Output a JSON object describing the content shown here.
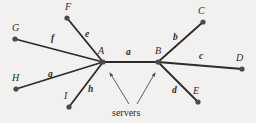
{
  "figure": {
    "background_color": "#f2f1ef",
    "stroke_color": "#2b2b2b",
    "node_color": "#4a4a4a",
    "annotation": {
      "label": "servers",
      "x": 112,
      "y": 108,
      "arrows": [
        {
          "name": "arrow-to-a",
          "from_x": 129,
          "from_y": 104,
          "to_x": 110,
          "to_y": 73
        },
        {
          "name": "arrow-to-b",
          "from_x": 137,
          "from_y": 104,
          "to_x": 155,
          "to_y": 73
        }
      ]
    },
    "nodes": [
      {
        "id": "A",
        "label": "A",
        "x": 103,
        "y": 62,
        "label_x": 98,
        "label_y": 46
      },
      {
        "id": "B",
        "label": "B",
        "x": 158,
        "y": 62,
        "label_x": 155,
        "label_y": 46
      },
      {
        "id": "C",
        "label": "C",
        "x": 203,
        "y": 22,
        "label_x": 198,
        "label_y": 6
      },
      {
        "id": "D",
        "label": "D",
        "x": 242,
        "y": 69,
        "label_x": 236,
        "label_y": 53
      },
      {
        "id": "E",
        "label": "E",
        "x": 198,
        "y": 102,
        "label_x": 193,
        "label_y": 86
      },
      {
        "id": "F",
        "label": "F",
        "x": 67,
        "y": 18,
        "label_x": 65,
        "label_y": 2
      },
      {
        "id": "G",
        "label": "G",
        "x": 15,
        "y": 39,
        "label_x": 12,
        "label_y": 23
      },
      {
        "id": "H",
        "label": "H",
        "x": 16,
        "y": 89,
        "label_x": 12,
        "label_y": 73
      },
      {
        "id": "I",
        "label": "I",
        "x": 69,
        "y": 107,
        "label_x": 64,
        "label_y": 91
      }
    ],
    "edges": [
      {
        "id": "a",
        "label": "a",
        "from": "A",
        "to": "B",
        "label_x": 126,
        "label_y": 48
      },
      {
        "id": "b",
        "label": "b",
        "from": "B",
        "to": "C",
        "label_x": 173,
        "label_y": 33
      },
      {
        "id": "c",
        "label": "c",
        "from": "B",
        "to": "D",
        "label_x": 199,
        "label_y": 52
      },
      {
        "id": "d",
        "label": "d",
        "from": "B",
        "to": "E",
        "label_x": 172,
        "label_y": 86
      },
      {
        "id": "e",
        "label": "e",
        "from": "A",
        "to": "F",
        "label_x": 85,
        "label_y": 30
      },
      {
        "id": "f",
        "label": "f",
        "from": "A",
        "to": "G",
        "label_x": 51,
        "label_y": 34
      },
      {
        "id": "g",
        "label": "g",
        "from": "A",
        "to": "H",
        "label_x": 48,
        "label_y": 70
      },
      {
        "id": "h",
        "label": "h",
        "from": "A",
        "to": "I",
        "label_x": 88,
        "label_y": 85
      }
    ]
  },
  "chart_data": {
    "type": "diagram",
    "title": "",
    "node_ids": [
      "A",
      "B",
      "C",
      "D",
      "E",
      "F",
      "G",
      "H",
      "I"
    ],
    "edge_ids": [
      "a",
      "b",
      "c",
      "d",
      "e",
      "f",
      "g",
      "h"
    ],
    "edge_list": [
      [
        "A",
        "B",
        "a"
      ],
      [
        "B",
        "C",
        "b"
      ],
      [
        "B",
        "D",
        "c"
      ],
      [
        "B",
        "E",
        "d"
      ],
      [
        "A",
        "F",
        "e"
      ],
      [
        "A",
        "G",
        "f"
      ],
      [
        "A",
        "H",
        "g"
      ],
      [
        "A",
        "I",
        "h"
      ]
    ],
    "annotations": [
      {
        "text": "servers",
        "points_to": [
          "A",
          "B"
        ]
      }
    ]
  }
}
